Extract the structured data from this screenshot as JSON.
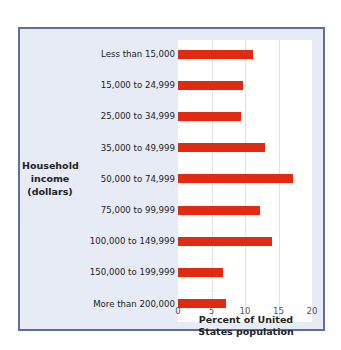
{
  "chart_data": {
    "type": "bar",
    "orientation": "horizontal",
    "title": "",
    "ylabel": "Household income (dollars)",
    "ylabel_lines": [
      "Household",
      "income",
      "(dollars)"
    ],
    "xlabel": "Percent of United States population",
    "xlabel_lines": [
      "Percent of United",
      "States population"
    ],
    "xlim": [
      0,
      20
    ],
    "xticks": [
      "0",
      "5",
      "10",
      "15",
      "20"
    ],
    "grid": true,
    "categories": [
      "Less than 15,000",
      "15,000 to 24,999",
      "25,000 to 34,999",
      "35,000 to 49,999",
      "50,000 to 74,999",
      "75,000 to 99,999",
      "100,000 to 149,999",
      "150,000 to 199,999",
      "More than 200,000"
    ],
    "values": [
      11.2,
      9.7,
      9.4,
      13.0,
      17.1,
      12.3,
      14.1,
      6.7,
      7.1
    ],
    "bar_color": "#e02a12",
    "panel_background": "#e6ebf5",
    "frame_color": "#5d6f9f"
  }
}
